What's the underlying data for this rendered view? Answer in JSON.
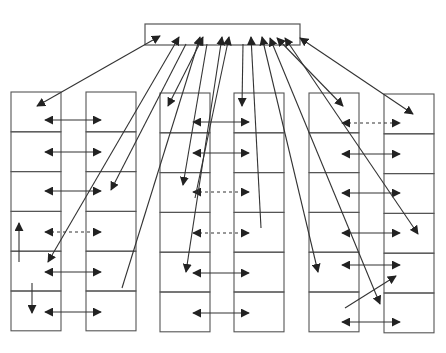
{
  "diagram": {
    "stroke_color": "#555555",
    "arrow_color": "#222222",
    "background": "#ffffff",
    "hub": {
      "x": 145,
      "y": 24,
      "w": 155,
      "h": 21
    },
    "columns": [
      {
        "id": "col-1",
        "x": 11,
        "y": 92,
        "w": 50,
        "rows": 6,
        "row_h": 39.8
      },
      {
        "id": "col-2",
        "x": 86,
        "y": 92,
        "w": 50,
        "rows": 6,
        "row_h": 39.8
      },
      {
        "id": "col-3",
        "x": 160,
        "y": 93,
        "w": 50,
        "rows": 6,
        "row_h": 39.8
      },
      {
        "id": "col-4",
        "x": 234,
        "y": 93,
        "w": 50,
        "rows": 6,
        "row_h": 39.8
      },
      {
        "id": "col-5",
        "x": 309,
        "y": 93,
        "w": 50,
        "rows": 6,
        "row_h": 39.8
      },
      {
        "id": "col-6",
        "x": 384,
        "y": 94,
        "w": 50,
        "rows": 6,
        "row_h": 39.8
      }
    ],
    "row_links": [
      {
        "x1": 45,
        "x2": 101,
        "y": 120,
        "style": "solid"
      },
      {
        "x1": 45,
        "x2": 101,
        "y": 152,
        "style": "solid"
      },
      {
        "x1": 45,
        "x2": 101,
        "y": 191,
        "style": "solid"
      },
      {
        "x1": 45,
        "x2": 101,
        "y": 232,
        "style": "dashed"
      },
      {
        "x1": 45,
        "x2": 101,
        "y": 272,
        "style": "solid"
      },
      {
        "x1": 45,
        "x2": 101,
        "y": 312,
        "style": "solid"
      },
      {
        "x1": 193,
        "x2": 249,
        "y": 122,
        "style": "solid"
      },
      {
        "x1": 193,
        "x2": 249,
        "y": 153,
        "style": "solid"
      },
      {
        "x1": 193,
        "x2": 249,
        "y": 192,
        "style": "dashed"
      },
      {
        "x1": 193,
        "x2": 249,
        "y": 233,
        "style": "dashed"
      },
      {
        "x1": 193,
        "x2": 249,
        "y": 273,
        "style": "solid"
      },
      {
        "x1": 193,
        "x2": 249,
        "y": 313,
        "style": "solid"
      },
      {
        "x1": 342,
        "x2": 400,
        "y": 123,
        "style": "dashed"
      },
      {
        "x1": 342,
        "x2": 400,
        "y": 154,
        "style": "solid"
      },
      {
        "x1": 342,
        "x2": 400,
        "y": 193,
        "style": "solid"
      },
      {
        "x1": 342,
        "x2": 400,
        "y": 233,
        "style": "solid"
      },
      {
        "x1": 342,
        "x2": 400,
        "y": 265,
        "style": "solid"
      },
      {
        "x1": 342,
        "x2": 400,
        "y": 322,
        "style": "solid"
      }
    ],
    "hub_links": [
      {
        "x1": 160,
        "y1": 36,
        "x2": 37,
        "y2": 106,
        "head_start": true,
        "head_end": true
      },
      {
        "x1": 179,
        "y1": 37,
        "x2": 48,
        "y2": 262,
        "head_start": true,
        "head_end": true
      },
      {
        "x1": 186,
        "y1": 44,
        "x2": 111,
        "y2": 190,
        "head_start": false,
        "head_end": true
      },
      {
        "x1": 200,
        "y1": 37,
        "x2": 122,
        "y2": 288,
        "head_start": true,
        "head_end": false
      },
      {
        "x1": 203,
        "y1": 37,
        "x2": 168,
        "y2": 106,
        "head_start": true,
        "head_end": true
      },
      {
        "x1": 207,
        "y1": 44,
        "x2": 183,
        "y2": 185,
        "head_start": false,
        "head_end": true
      },
      {
        "x1": 222,
        "y1": 37,
        "x2": 186,
        "y2": 272,
        "head_start": true,
        "head_end": true
      },
      {
        "x1": 229,
        "y1": 37,
        "x2": 195,
        "y2": 198,
        "head_start": true,
        "head_end": false
      },
      {
        "x1": 243,
        "y1": 44,
        "x2": 242,
        "y2": 106,
        "head_start": false,
        "head_end": true
      },
      {
        "x1": 251,
        "y1": 37,
        "x2": 261,
        "y2": 228,
        "head_start": true,
        "head_end": false
      },
      {
        "x1": 262,
        "y1": 37,
        "x2": 318,
        "y2": 272,
        "head_start": true,
        "head_end": true
      },
      {
        "x1": 270,
        "y1": 38,
        "x2": 380,
        "y2": 304,
        "head_start": true,
        "head_end": true
      },
      {
        "x1": 277,
        "y1": 38,
        "x2": 343,
        "y2": 106,
        "head_start": true,
        "head_end": true
      },
      {
        "x1": 285,
        "y1": 38,
        "x2": 418,
        "y2": 234,
        "head_start": true,
        "head_end": true
      },
      {
        "x1": 300,
        "y1": 38,
        "x2": 413,
        "y2": 114,
        "head_start": true,
        "head_end": true
      }
    ],
    "extra_links": [
      {
        "x1": 19,
        "y1": 262,
        "x2": 19,
        "y2": 223,
        "head_start": false,
        "head_end": true
      },
      {
        "x1": 32,
        "y1": 283,
        "x2": 32,
        "y2": 313,
        "head_start": false,
        "head_end": true
      },
      {
        "x1": 345,
        "y1": 308,
        "x2": 396,
        "y2": 276,
        "head_start": false,
        "head_end": true
      }
    ]
  }
}
